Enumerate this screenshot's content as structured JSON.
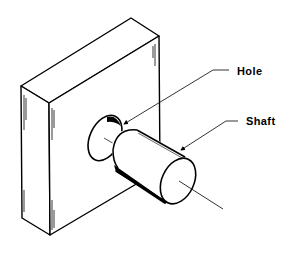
{
  "diagram": {
    "type": "technical-illustration",
    "labels": {
      "hole": "Hole",
      "shaft": "Shaft"
    },
    "colors": {
      "line": "#000000",
      "background": "#ffffff"
    }
  }
}
